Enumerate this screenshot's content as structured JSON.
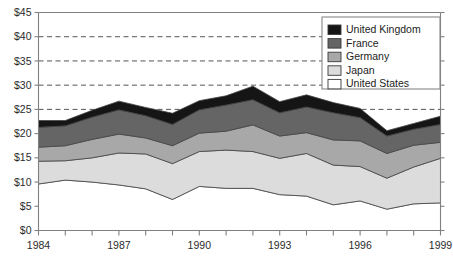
{
  "chart_data": {
    "type": "area",
    "stacked": true,
    "title": "",
    "subtitle": "",
    "xlabel": "",
    "ylabel": "",
    "x": [
      1984,
      1985,
      1986,
      1987,
      1988,
      1989,
      1990,
      1991,
      1992,
      1993,
      1994,
      1995,
      1996,
      1997,
      1998,
      1999
    ],
    "xlim": [
      1984,
      1999
    ],
    "ylim": [
      0,
      45
    ],
    "ytick_values": [
      0,
      5,
      10,
      15,
      20,
      25,
      30,
      35,
      40,
      45
    ],
    "ytick_labels": [
      "$0",
      "$5",
      "$10",
      "$15",
      "$20",
      "$25",
      "$30",
      "$35",
      "$40",
      "$45"
    ],
    "xtick_values": [
      1984,
      1985,
      1986,
      1987,
      1988,
      1989,
      1990,
      1991,
      1992,
      1993,
      1994,
      1995,
      1996,
      1997,
      1998,
      1999
    ],
    "xtick_labels_shown": [
      "1984",
      "1987",
      "1990",
      "1993",
      "1996",
      "1999"
    ],
    "xtick_labeled_values": [
      1984,
      1987,
      1990,
      1993,
      1996,
      1999
    ],
    "gridlines": {
      "horizontal": true,
      "horizontal_values": [
        25,
        30,
        35,
        40
      ],
      "style": "dashed",
      "vertical": false
    },
    "legend_position": "top-right",
    "series": [
      {
        "name": "United States",
        "color": "#ffffff",
        "values": [
          9.6,
          10.4,
          10.0,
          9.4,
          8.6,
          6.4,
          9.1,
          8.7,
          8.7,
          7.4,
          7.1,
          5.3,
          6.1,
          4.4,
          5.5,
          5.7
        ]
      },
      {
        "name": "Japan",
        "color": "#dcdcdc",
        "values": [
          4.7,
          4.0,
          5.0,
          6.6,
          7.2,
          7.4,
          7.2,
          7.9,
          7.6,
          7.5,
          8.8,
          8.2,
          7.1,
          6.4,
          7.6,
          9.2
        ]
      },
      {
        "name": "Germany",
        "color": "#a8a8a8",
        "values": [
          2.9,
          3.1,
          3.8,
          3.9,
          3.3,
          3.7,
          3.8,
          3.9,
          5.5,
          4.6,
          4.3,
          5.2,
          5.3,
          5.1,
          4.5,
          3.3
        ]
      },
      {
        "name": "France",
        "color": "#656565",
        "values": [
          4.1,
          4.1,
          4.6,
          5.0,
          4.6,
          4.4,
          4.8,
          5.4,
          5.2,
          4.8,
          5.3,
          5.6,
          4.8,
          3.6,
          3.3,
          3.7
        ]
      },
      {
        "name": "United Kingdom",
        "color": "#151515",
        "values": [
          1.4,
          1.1,
          1.4,
          1.8,
          1.7,
          2.3,
          1.9,
          1.9,
          2.8,
          2.3,
          2.5,
          2.1,
          1.9,
          1.1,
          1.2,
          1.7
        ]
      }
    ],
    "totals": [
      22.7,
      22.7,
      24.8,
      26.7,
      25.4,
      24.2,
      26.8,
      27.8,
      29.8,
      26.6,
      28.0,
      26.4,
      25.2,
      20.6,
      22.1,
      23.6
    ],
    "legend_entries": [
      {
        "label": "United Kingdom",
        "color": "#151515"
      },
      {
        "label": "France",
        "color": "#656565"
      },
      {
        "label": "Germany",
        "color": "#a8a8a8"
      },
      {
        "label": "Japan",
        "color": "#dcdcdc"
      },
      {
        "label": "United States",
        "color": "#ffffff"
      }
    ]
  },
  "style": {
    "axis_color": "#808080",
    "grid_color": "#555555",
    "series_outline": "#444444",
    "text_color": "#2b2b2b",
    "legend_border": "#888888",
    "background": "#ffffff"
  }
}
